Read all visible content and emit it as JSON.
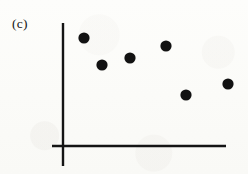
{
  "figure": {
    "panel_label": "(c)",
    "background_color": "#fcfcfa",
    "ink_color": "#141414"
  },
  "chart_data": {
    "type": "scatter",
    "title": "(c)",
    "subtitle": "",
    "xlabel": "",
    "ylabel": "",
    "xlim": [
      0,
      248
    ],
    "ylim": [
      0,
      174
    ],
    "grid": false,
    "legend": null,
    "axis_style": {
      "y_axis_x": 63,
      "y_axis_top": 23,
      "y_axis_bottom": 166,
      "x_axis_y": 146,
      "x_axis_left": 52,
      "x_axis_right": 226,
      "line_width": 2.4,
      "color": "#141414",
      "ticks": [],
      "tick_labels": []
    },
    "marker": {
      "shape": "circle",
      "radius": 5.6,
      "fill": "#121212",
      "edge": "none"
    },
    "points": [
      {
        "x": 84,
        "y": 38
      },
      {
        "x": 102,
        "y": 65
      },
      {
        "x": 130,
        "y": 58
      },
      {
        "x": 166,
        "y": 46
      },
      {
        "x": 186,
        "y": 95
      },
      {
        "x": 228,
        "y": 84
      }
    ],
    "series": [
      {
        "name": "series-1",
        "x": [
          84,
          102,
          130,
          166,
          186,
          228
        ],
        "y": [
          38,
          65,
          58,
          46,
          95,
          84
        ]
      }
    ],
    "n_points": 6,
    "annotations": []
  }
}
